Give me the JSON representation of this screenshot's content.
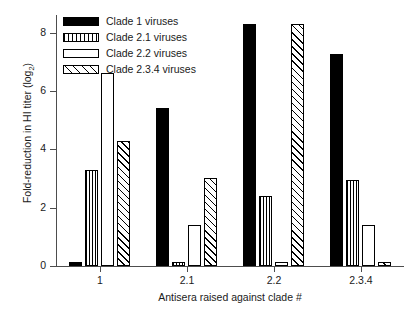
{
  "chart_data": {
    "type": "bar",
    "title": "",
    "xlabel": "Antisera raised against clade #",
    "ylabel": "Fold-reduction in HI titer (log2)",
    "ylabel_base": "Fold-reduction in HI titer (log",
    "ylabel_sub": "2",
    "ylabel_tail": ")",
    "categories": [
      "1",
      "2.1",
      "2.2",
      "2.3.4"
    ],
    "ylim": [
      0,
      8.6
    ],
    "yticks": [
      0,
      2,
      4,
      6,
      8
    ],
    "ytick_labels": [
      "0",
      "2",
      "4",
      "6",
      "8"
    ],
    "grid": false,
    "legend_position": "top-left",
    "series": [
      {
        "name": "Clade 1 viruses",
        "pattern": "solid",
        "values": [
          0.15,
          5.4,
          8.3,
          7.25
        ]
      },
      {
        "name": "Clade 2.1 viruses",
        "pattern": "vertical-lines",
        "values": [
          3.3,
          0.15,
          2.4,
          2.95
        ]
      },
      {
        "name": "Clade 2.2 viruses",
        "pattern": "open",
        "values": [
          6.6,
          1.4,
          0.15,
          1.4
        ]
      },
      {
        "name": "Clade 2.3.4 viruses",
        "pattern": "diagonal-hatch",
        "values": [
          4.3,
          3.0,
          8.3,
          0.15
        ]
      }
    ]
  },
  "legend": {
    "items": [
      {
        "label": "Clade 1 viruses",
        "pattern": "solid"
      },
      {
        "label": "Clade 2.1 viruses",
        "pattern": "vlines"
      },
      {
        "label": "Clade 2.2 viruses",
        "pattern": "empty"
      },
      {
        "label": "Clade 2.3.4 viruses",
        "pattern": "diag"
      }
    ]
  },
  "colors": {
    "axis": "#4d4d4d",
    "text": "#1a1a1a",
    "bar_fill": "#000000",
    "bar_open": "#ffffff",
    "background": "#ffffff"
  }
}
